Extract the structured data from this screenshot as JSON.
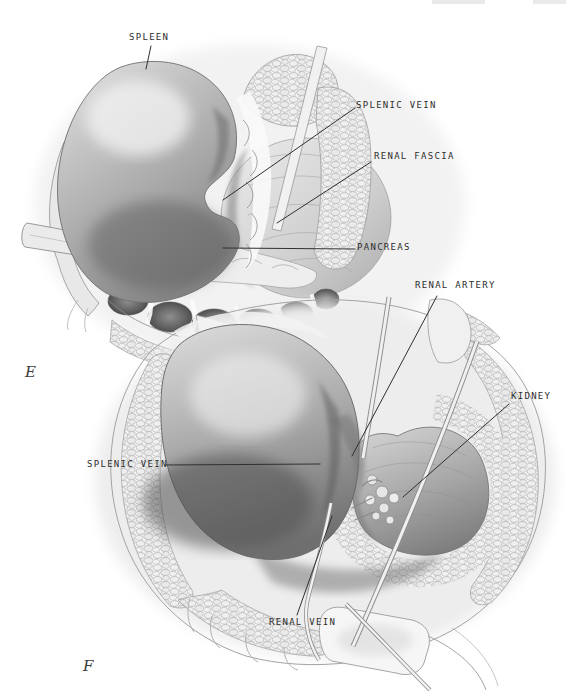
{
  "panels": {
    "e": {
      "letter": "E",
      "labels": [
        {
          "id": "spleen",
          "text": "SPLEEN"
        },
        {
          "id": "splenic_vein",
          "text": "SPLENIC VEIN"
        },
        {
          "id": "renal_fascia",
          "text": "RENAL FASCIA"
        },
        {
          "id": "pancreas",
          "text": "PANCREAS"
        }
      ]
    },
    "f": {
      "letter": "F",
      "labels": [
        {
          "id": "renal_artery",
          "text": "RENAL ARTERY"
        },
        {
          "id": "kidney",
          "text": "KIDNEY"
        },
        {
          "id": "splenic_vein",
          "text": "SPLENIC VEIN"
        },
        {
          "id": "renal_vein",
          "text": "RENAL VEIN"
        }
      ]
    }
  },
  "colors": {
    "paper": "#ffffff",
    "label_ink": "#2d2d2d",
    "leader_line": "#303030",
    "pencil_light": "#ededed",
    "pencil_mid": "#9a9a9a",
    "pencil_dark": "#565656"
  }
}
